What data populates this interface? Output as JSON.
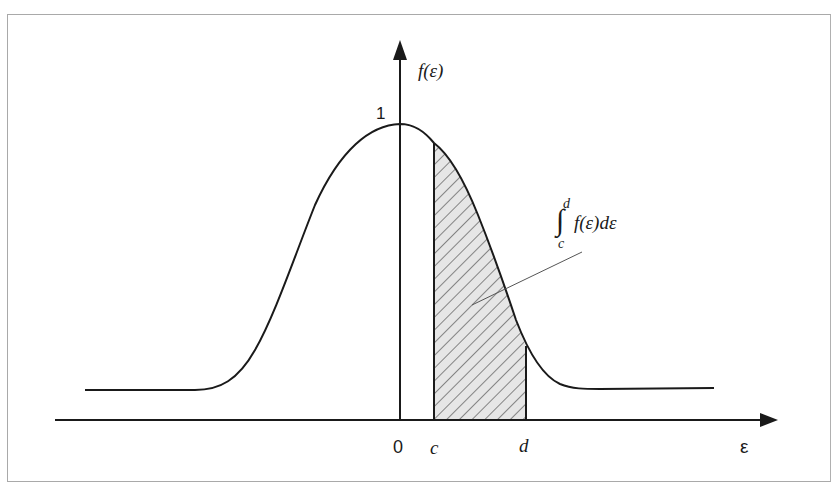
{
  "diagram": {
    "y_axis_label": "f(ε)",
    "x_axis_label": "ε",
    "peak_label": "1",
    "x_ticks": [
      {
        "label": "0",
        "x": 400
      },
      {
        "label": "c",
        "x": 434
      },
      {
        "label": "d",
        "x": 525
      }
    ],
    "integral_label": {
      "upper": "d",
      "lower": "c",
      "integral_sign": "∫",
      "integrand": "f(ε)dε"
    },
    "colors": {
      "curve": "#1a1a1a",
      "axes": "#1a1a1a",
      "hatch": "#333333",
      "shade_fill": "#e6e6e6",
      "frame": "#a9a9a9",
      "leader_line": "#555555"
    }
  }
}
